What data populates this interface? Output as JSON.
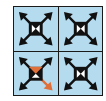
{
  "colors": {
    "cell_background": "#b5dbef",
    "grid_line": "#1a1a1a",
    "icon": "#111111",
    "highlight": "#e0703a"
  },
  "cells": [
    {
      "position": "top-left",
      "icon": "move-arrows-icon",
      "highlighted": false
    },
    {
      "position": "top-right",
      "icon": "move-arrows-icon",
      "highlighted": false
    },
    {
      "position": "bottom-left",
      "icon": "move-arrows-icon",
      "highlighted": true,
      "highlight_parts": [
        "center-top",
        "arrow-bottom-right"
      ]
    },
    {
      "position": "bottom-right",
      "icon": "move-arrows-icon",
      "highlighted": false
    }
  ]
}
